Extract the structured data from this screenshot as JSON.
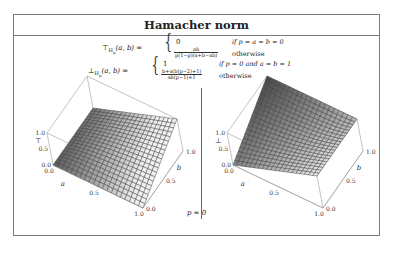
{
  "title": "Hamacher norm",
  "tnorm": {
    "lhs": "⊤",
    "sub": "H",
    "subsub": "p",
    "args": "(a, b) =",
    "case1_value": "0",
    "case1_cond": "if p = a = b = 0",
    "case2_num": "ab",
    "case2_den": "p(1−p)(a+b−ab)",
    "case2_cond": "otherwise"
  },
  "tconorm": {
    "lhs": "⊥",
    "sub": "H",
    "subsub": "p",
    "args": "(a, b) =",
    "case1_value": "1",
    "case1_cond": "if p = 0 and a = b = 1",
    "case2_num": "b+a(b(p−2)+1)",
    "case2_den": "ab(p−1)+1",
    "case2_cond": "otherwise"
  },
  "caption": "p = 0",
  "chart_data": [
    {
      "type": "surface3d",
      "name": "t-norm plot",
      "zlabel": "⊤",
      "xlabel": "a",
      "ylabel": "b",
      "x_ticks": [
        "0.0",
        "0.5",
        "1.0"
      ],
      "y_ticks": [
        "0.0",
        "0.5",
        "1.0"
      ],
      "z_ticks": [
        "0.0",
        "0.5",
        "1.0"
      ],
      "xlim": [
        0,
        1
      ],
      "ylim": [
        0,
        1
      ],
      "zlim": [
        0,
        1
      ],
      "p": 0,
      "function": "ab/(a+b-ab)",
      "grid_divisions": 20
    },
    {
      "type": "surface3d",
      "name": "t-conorm plot",
      "zlabel": "⊥",
      "xlabel": "a",
      "ylabel": "b",
      "x_ticks": [
        "0.0",
        "0.5",
        "1.0"
      ],
      "y_ticks": [
        "0.0",
        "0.5",
        "1.0"
      ],
      "z_ticks": [
        "0.0",
        "0.5",
        "1.0"
      ],
      "xlim": [
        0,
        1
      ],
      "ylim": [
        0,
        1
      ],
      "zlim": [
        0,
        1
      ],
      "p": 0,
      "function": "(b+a(1-2b))/(1-ab)",
      "grid_divisions": 20
    }
  ]
}
